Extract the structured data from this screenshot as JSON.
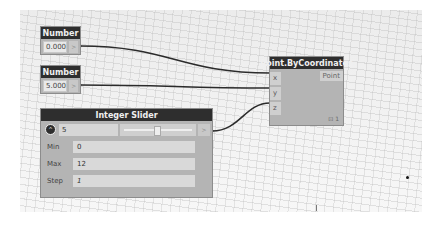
{
  "canvas": {
    "background": "#f0f0f0"
  },
  "nodes": {
    "number_1": {
      "title": "Number",
      "value": "0.000",
      "output_port": ">"
    },
    "number_2": {
      "title": "Number",
      "value": "5.000",
      "output_port": ">"
    },
    "point": {
      "title": "Point.ByCoordinates",
      "inputs": [
        "x",
        "y",
        "z"
      ],
      "output": "Point",
      "footer": "⊡ 1"
    },
    "slider": {
      "title": "Integer Slider",
      "toggle_icon": "^",
      "value": "5",
      "output_port": ">",
      "properties": [
        {
          "label": "Min",
          "value": "0"
        },
        {
          "label": "Max",
          "value": "12"
        },
        {
          "label": "Step",
          "value": "1"
        }
      ]
    }
  },
  "colors": {
    "node_header": "#2e2e2e",
    "node_body": "#b4b4b4",
    "wire": "#2b2b2b"
  }
}
